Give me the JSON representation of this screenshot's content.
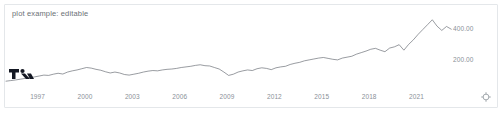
{
  "widget": {
    "title": "plot example: editable",
    "brand_logo": "tradingview-logo",
    "reset_icon": "reset-target-icon",
    "background_color": "#ffffff",
    "border_color": "#e4e7ea",
    "line_color": "#5a5f66",
    "axis_text_color": "#8a9098",
    "title_color": "#6b7076"
  },
  "chart_data": {
    "type": "line",
    "title": "plot example: editable",
    "xlabel": "",
    "ylabel": "",
    "grid": false,
    "legend": null,
    "xlim": [
      1995.0,
      2023.5
    ],
    "ylim": [
      0,
      500
    ],
    "ytick_labels": [
      "400.00",
      "200.00"
    ],
    "ytick_values": [
      400,
      200
    ],
    "xtick_labels": [
      "1997",
      "2000",
      "2003",
      "2006",
      "2009",
      "2012",
      "2015",
      "2018",
      "2021"
    ],
    "xtick_values": [
      1997,
      2000,
      2003,
      2006,
      2009,
      2012,
      2015,
      2018,
      2021
    ],
    "series": [
      {
        "name": "price",
        "color": "#5a5f66",
        "x": [
          1995.0,
          1995.3,
          1995.6,
          1995.9,
          1996.2,
          1996.5,
          1996.8,
          1997.1,
          1997.4,
          1997.7,
          1998.0,
          1998.3,
          1998.6,
          1998.9,
          1999.2,
          1999.5,
          1999.8,
          2000.1,
          2000.4,
          2000.7,
          2001.0,
          2001.3,
          2001.6,
          2001.9,
          2002.2,
          2002.5,
          2002.8,
          2003.1,
          2003.4,
          2003.7,
          2004.0,
          2004.3,
          2004.6,
          2004.9,
          2005.2,
          2005.5,
          2005.8,
          2006.1,
          2006.4,
          2006.7,
          2007.0,
          2007.3,
          2007.6,
          2007.9,
          2008.2,
          2008.5,
          2008.8,
          2009.1,
          2009.4,
          2009.7,
          2010.0,
          2010.3,
          2010.6,
          2010.9,
          2011.2,
          2011.5,
          2011.8,
          2012.1,
          2012.4,
          2012.7,
          2013.0,
          2013.3,
          2013.6,
          2013.9,
          2014.2,
          2014.5,
          2014.8,
          2015.1,
          2015.4,
          2015.7,
          2016.0,
          2016.3,
          2016.6,
          2016.9,
          2017.2,
          2017.5,
          2017.8,
          2018.1,
          2018.4,
          2018.7,
          2019.0,
          2019.3,
          2019.6,
          2019.9,
          2020.2,
          2020.5,
          2020.8,
          2021.1,
          2021.4,
          2021.7,
          2022.0,
          2022.3,
          2022.6,
          2022.9,
          2023.2
        ],
        "y": [
          58,
          62,
          66,
          71,
          76,
          80,
          86,
          92,
          98,
          96,
          104,
          110,
          105,
          118,
          126,
          132,
          140,
          148,
          144,
          136,
          130,
          120,
          112,
          118,
          112,
          102,
          98,
          104,
          110,
          118,
          124,
          128,
          126,
          132,
          136,
          138,
          142,
          148,
          152,
          156,
          162,
          166,
          160,
          158,
          148,
          138,
          118,
          96,
          104,
          118,
          126,
          132,
          128,
          140,
          146,
          142,
          134,
          146,
          152,
          156,
          168,
          176,
          182,
          192,
          198,
          204,
          210,
          214,
          208,
          202,
          198,
          210,
          216,
          222,
          236,
          246,
          256,
          268,
          274,
          262,
          252,
          276,
          284,
          298,
          262,
          300,
          330,
          366,
          398,
          430,
          462,
          420,
          392,
          418,
          400
        ]
      }
    ]
  }
}
